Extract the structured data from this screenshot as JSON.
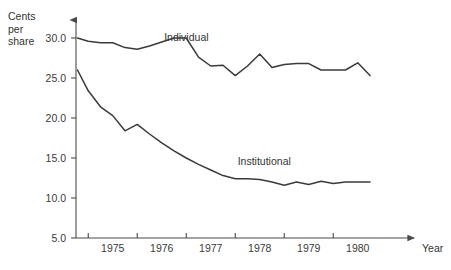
{
  "chart_data": {
    "type": "line",
    "title": "",
    "xlabel": "Year",
    "ylabel": "Cents per share",
    "ylabel_lines": [
      "Cents",
      "per",
      "share"
    ],
    "xlim": [
      1974.75,
      1980.85
    ],
    "ylim": [
      5.0,
      30.0
    ],
    "grid": false,
    "legend": "inline-labels",
    "y_ticks": [
      "30.0",
      "25.0",
      "20.0",
      "15.0",
      "10.0",
      "5.0"
    ],
    "y_tick_values": [
      30.0,
      25.0,
      20.0,
      15.0,
      10.0,
      5.0
    ],
    "x_ticks": [
      "1975",
      "1976",
      "1977",
      "1978",
      "1979",
      "1980"
    ],
    "x_tick_values": [
      1975,
      1976,
      1977,
      1978,
      1979,
      1980
    ],
    "series": [
      {
        "name": "Individual",
        "label_x": 1976.55,
        "label_y": 29.6,
        "x": [
          1974.78,
          1975.0,
          1975.25,
          1975.5,
          1975.75,
          1976.0,
          1976.25,
          1976.5,
          1976.75,
          1977.0,
          1977.25,
          1977.5,
          1977.75,
          1978.0,
          1978.25,
          1978.5,
          1978.75,
          1979.0,
          1979.25,
          1979.5,
          1979.75,
          1980.0,
          1980.25,
          1980.5,
          1980.75
        ],
        "values": [
          30.0,
          29.6,
          29.4,
          29.4,
          28.8,
          28.6,
          29.0,
          29.5,
          30.0,
          30.0,
          27.6,
          26.5,
          26.6,
          25.3,
          26.5,
          28.0,
          26.3,
          26.7,
          26.8,
          26.8,
          26.0,
          26.0,
          26.0,
          26.9,
          25.3
        ]
      },
      {
        "name": "Institutional",
        "label_x": 1978.05,
        "label_y": 14.1,
        "x": [
          1974.78,
          1975.0,
          1975.25,
          1975.5,
          1975.75,
          1976.0,
          1976.25,
          1976.5,
          1976.75,
          1977.0,
          1977.25,
          1977.5,
          1977.75,
          1978.0,
          1978.25,
          1978.5,
          1978.75,
          1979.0,
          1979.25,
          1979.5,
          1979.75,
          1980.0,
          1980.25,
          1980.5,
          1980.75
        ],
        "values": [
          26.0,
          23.4,
          21.4,
          20.3,
          18.4,
          19.2,
          18.0,
          16.9,
          15.9,
          15.0,
          14.2,
          13.5,
          12.8,
          12.4,
          12.4,
          12.3,
          12.0,
          11.6,
          12.0,
          11.7,
          12.1,
          11.8,
          12.0,
          12.0,
          12.0
        ]
      }
    ]
  }
}
